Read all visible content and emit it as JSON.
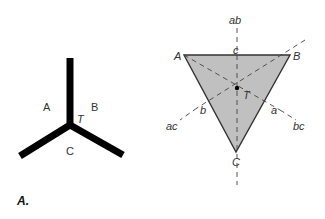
{
  "figure": {
    "panel_label": "A.",
    "left_diagram": {
      "description": "Triple junction of three grain boundaries",
      "regions": {
        "a": "A",
        "b": "B",
        "c": "C"
      },
      "junction_label": "T",
      "line_color": "#000000"
    },
    "right_diagram": {
      "description": "Triangle with vertices A, B, C, medians/bisectors meeting at T",
      "vertices": {
        "a": "A",
        "b": "B",
        "c": "C"
      },
      "center_label": "T",
      "edge_midpoints": {
        "ab": "c",
        "ac": "b",
        "bc": "a"
      },
      "bisector_labels": {
        "ab": "ab",
        "ac": "ac",
        "bc": "bc"
      },
      "fill_color": "#c0c0c0",
      "edge_color": "#333333"
    }
  }
}
